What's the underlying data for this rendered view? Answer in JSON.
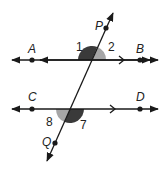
{
  "diagram": {
    "colors": {
      "line": "#1a1a1a",
      "dark_angle": "#3a3a3a",
      "light_angle": "#a6a6a6",
      "background": "#ffffff"
    },
    "lines": [
      {
        "name": "AB",
        "points": [
          "A",
          "B"
        ],
        "parallel_marker": ">"
      },
      {
        "name": "CD",
        "points": [
          "C",
          "D"
        ],
        "parallel_marker": ">"
      },
      {
        "name": "PQ",
        "points": [
          "P",
          "Q"
        ],
        "role": "transversal"
      }
    ],
    "points": {
      "A": "A",
      "B": "B",
      "C": "C",
      "D": "D",
      "P": "P",
      "Q": "Q"
    },
    "angles": {
      "a1": {
        "label": "1",
        "shade": "dark",
        "position": "upper-left at AB"
      },
      "a2": {
        "label": "2",
        "shade": "light",
        "position": "upper-right at AB"
      },
      "a7": {
        "label": "7",
        "shade": "dark",
        "position": "lower-right at CD"
      },
      "a8": {
        "label": "8",
        "shade": "light",
        "position": "lower-left at CD"
      }
    }
  }
}
